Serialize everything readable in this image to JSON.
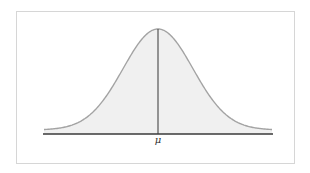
{
  "figure": {
    "type": "normal-distribution-diagram",
    "mean_label": "μ",
    "colors": {
      "frame_border": "#d6d6d6",
      "curve_stroke": "#a3a3a3",
      "curve_fill": "#f0f0f0",
      "axis": "#3a3a3a",
      "mean_line": "#555555",
      "label": "#333333"
    }
  }
}
